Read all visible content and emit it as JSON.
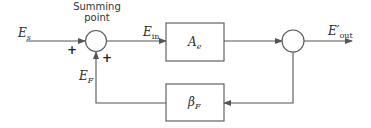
{
  "diagram": {
    "type": "feedback-block-diagram",
    "summing_point_label": [
      "Summing",
      "point"
    ],
    "input_signal": {
      "base": "E",
      "sub": "s"
    },
    "error_signal": {
      "base": "E",
      "sub": "in"
    },
    "feedback_signal": {
      "base": "E",
      "sub": "F"
    },
    "output_signal": {
      "base": "E′",
      "sub": "out"
    },
    "forward_block": {
      "base": "A",
      "sub": "e"
    },
    "feedback_block": {
      "base": "β",
      "sub": "F"
    },
    "signs": {
      "input": "+",
      "feedback": "+"
    },
    "colors": {
      "line": "#555555",
      "text": "#2a2a2a",
      "background": "#ffffff"
    }
  }
}
